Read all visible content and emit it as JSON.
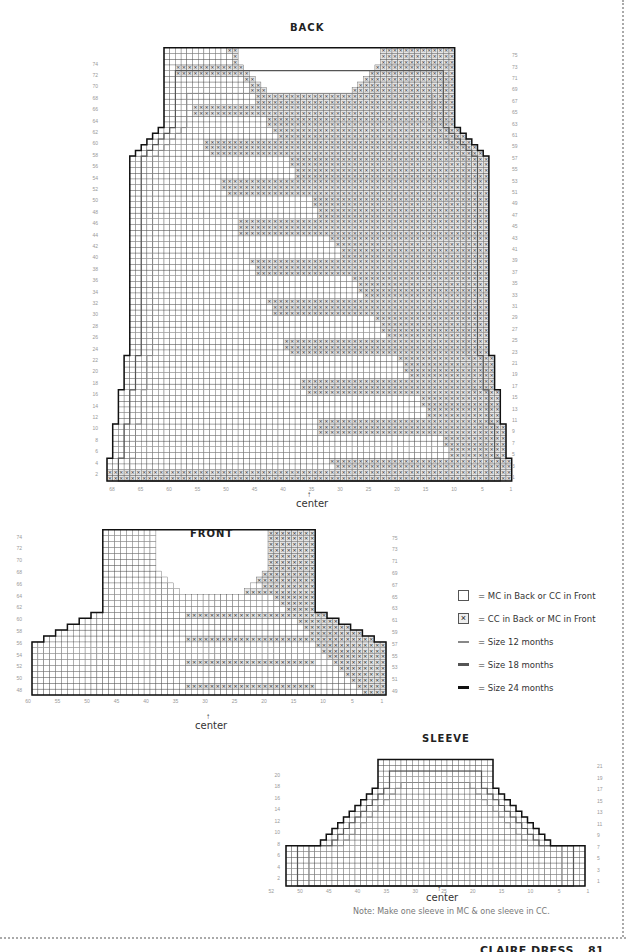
{
  "page": {
    "footer_title": "CLAIRE DRESS",
    "page_number": "81",
    "note": "Note:  Make one sleeve in MC & one sleeve in CC."
  },
  "legend": {
    "items": [
      {
        "symbol": "empty-square",
        "label": "= MC in Back or CC in Front"
      },
      {
        "symbol": "x-square",
        "label": "= CC in Back or MC in Front"
      },
      {
        "symbol": "line-thin",
        "label": "= Size 12 months",
        "color": "#888888"
      },
      {
        "symbol": "line-medium",
        "label": "= Size 18 months",
        "color": "#555555"
      },
      {
        "symbol": "line-thick",
        "label": "= Size 24 months",
        "color": "#111111"
      }
    ]
  },
  "chart_data": [
    {
      "type": "table",
      "title": "BACK",
      "center_label": "center",
      "columns": 58,
      "rows": 76,
      "left_row_labels": [
        "2",
        "4",
        "6",
        "8",
        "10",
        "12",
        "14",
        "16",
        "18",
        "20",
        "22",
        "24",
        "26",
        "28",
        "30",
        "32",
        "34",
        "36",
        "38",
        "40",
        "42",
        "44",
        "46",
        "48",
        "50",
        "52",
        "54",
        "56",
        "58",
        "60",
        "62",
        "64",
        "66",
        "68",
        "70",
        "72",
        "74"
      ],
      "right_row_labels": [
        "1",
        "3",
        "5",
        "7",
        "9",
        "11",
        "13",
        "15",
        "17",
        "19",
        "21",
        "23",
        "25",
        "27",
        "29",
        "31",
        "33",
        "35",
        "37",
        "39",
        "41",
        "43",
        "45",
        "47",
        "49",
        "51",
        "53",
        "55",
        "57",
        "59",
        "61",
        "63",
        "65",
        "67",
        "69",
        "71",
        "73",
        "75"
      ],
      "bottom_col_labels": [
        "1",
        "5",
        "10",
        "15",
        "20",
        "25",
        "30",
        "35",
        "40",
        "45",
        "50",
        "55",
        "60",
        "65",
        "68"
      ]
    },
    {
      "type": "table",
      "title": "FRONT",
      "center_label": "center",
      "left_row_labels": [
        "48",
        "50",
        "52",
        "54",
        "56",
        "58",
        "60",
        "62",
        "64",
        "66",
        "68",
        "70",
        "72",
        "74"
      ],
      "right_row_labels": [
        "49",
        "51",
        "53",
        "55",
        "57",
        "59",
        "61",
        "63",
        "65",
        "67",
        "69",
        "71",
        "73",
        "75"
      ],
      "bottom_col_labels": [
        "1",
        "5",
        "10",
        "15",
        "20",
        "25",
        "30",
        "35",
        "40",
        "45",
        "50",
        "55",
        "60"
      ]
    },
    {
      "type": "table",
      "title": "SLEEVE",
      "center_label": "center",
      "left_row_labels": [
        "2",
        "4",
        "6",
        "8",
        "10",
        "12",
        "14",
        "16",
        "18",
        "20"
      ],
      "right_row_labels": [
        "1",
        "3",
        "5",
        "7",
        "9",
        "11",
        "13",
        "15",
        "17",
        "19",
        "21"
      ],
      "bottom_col_labels": [
        "1",
        "5",
        "10",
        "15",
        "20",
        "25",
        "30",
        "35",
        "40",
        "45",
        "50",
        "52"
      ]
    }
  ]
}
